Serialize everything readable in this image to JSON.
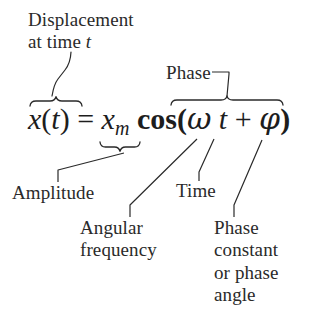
{
  "figure": {
    "kind": "annotated-equation-diagram",
    "ink_color": "#2a2a2a",
    "background_color": "#ffffff"
  },
  "equation": {
    "full_text": "x(t) = x_m cos(ωt + φ)",
    "lhs_variable": "x",
    "lhs_open_paren": "(",
    "lhs_argument": "t",
    "lhs_close_paren": ")",
    "equals": "=",
    "amplitude_symbol": "x",
    "amplitude_subscript": "m",
    "function_name": "cos",
    "arg_open_paren": "(",
    "angular_frequency_symbol": "ω",
    "time_symbol": "t",
    "plus": "+",
    "phase_constant_symbol": "φ",
    "arg_close_paren": ")"
  },
  "callouts": {
    "displacement": {
      "line1": "Displacement",
      "line2_prefix": "at time ",
      "line2_symbol": "t",
      "points_to": "x(t)"
    },
    "phase": {
      "text": "Phase",
      "points_to": "ωt + φ"
    },
    "amplitude": {
      "text": "Amplitude",
      "points_to": "x_m"
    },
    "time": {
      "text": "Time",
      "points_to": "t"
    },
    "angular_frequency": {
      "line1": "Angular",
      "line2": "frequency",
      "points_to": "ω"
    },
    "phase_constant": {
      "line1": "Phase",
      "line2": "constant",
      "line3": "or phase",
      "line4": "angle",
      "points_to": "φ"
    }
  }
}
